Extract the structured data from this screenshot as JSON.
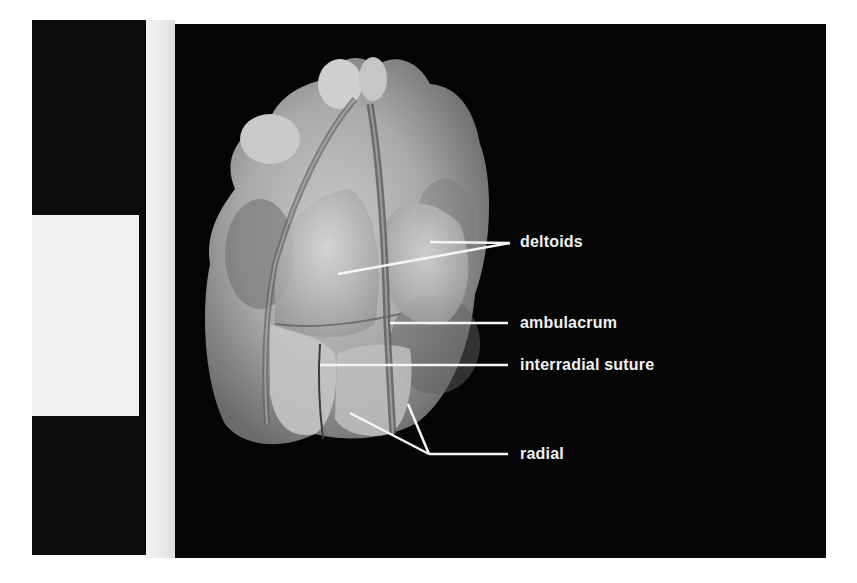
{
  "figure": {
    "labels": [
      {
        "id": "deltoids",
        "text": "deltoids"
      },
      {
        "id": "ambulacrum",
        "text": "ambulacrum"
      },
      {
        "id": "interradial-suture",
        "text": "interradial suture"
      },
      {
        "id": "radial",
        "text": "radial"
      }
    ],
    "colors": {
      "background": "#050505",
      "label": "#f2f2f2",
      "leader_line": "#f5f5f5"
    }
  }
}
